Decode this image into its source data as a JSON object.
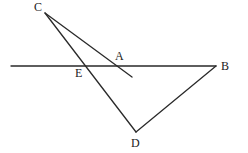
{
  "diagram": {
    "type": "geometry",
    "colors": {
      "line": "#2a2a2a",
      "label": "#222222",
      "background": "#ffffff"
    },
    "points": {
      "C": {
        "label": "C",
        "x": 45,
        "y": 13,
        "label_x": 34,
        "label_y": 11
      },
      "A": {
        "label": "A",
        "x": 120,
        "y": 66,
        "label_x": 115,
        "label_y": 60
      },
      "E": {
        "label": "E",
        "x": 84,
        "y": 66,
        "label_x": 75,
        "label_y": 77
      },
      "B": {
        "label": "B",
        "x": 216,
        "y": 66,
        "label_x": 221,
        "label_y": 70
      },
      "D": {
        "label": "D",
        "x": 136,
        "y": 132,
        "label_x": 131,
        "label_y": 147
      }
    },
    "segments": [
      {
        "name": "horizontal-line-through-E-A-to-B",
        "x1": 11,
        "y1": 66,
        "x2": 216,
        "y2": 66
      },
      {
        "name": "segment-C-through-A",
        "x1": 45,
        "y1": 13,
        "x2": 132,
        "y2": 77
      },
      {
        "name": "segment-C-D",
        "x1": 45,
        "y1": 13,
        "x2": 136,
        "y2": 132
      },
      {
        "name": "segment-B-D",
        "x1": 216,
        "y1": 66,
        "x2": 136,
        "y2": 132
      }
    ]
  }
}
